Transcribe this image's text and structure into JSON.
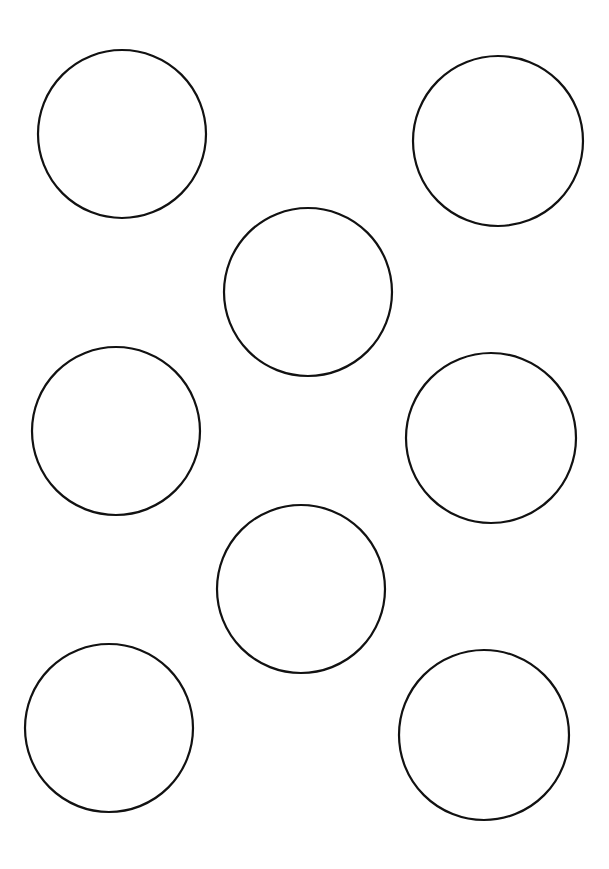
{
  "canvas": {
    "width": 609,
    "height": 869,
    "background": "#ffffff"
  },
  "style": {
    "stroke": "#111111",
    "stroke_width": 2.2,
    "fill": "none"
  },
  "circles": [
    {
      "id": "circle-1",
      "cx": 122,
      "cy": 134,
      "r": 84
    },
    {
      "id": "circle-2",
      "cx": 498,
      "cy": 141,
      "r": 85
    },
    {
      "id": "circle-3",
      "cx": 308,
      "cy": 292,
      "r": 84
    },
    {
      "id": "circle-4",
      "cx": 116,
      "cy": 431,
      "r": 84
    },
    {
      "id": "circle-5",
      "cx": 491,
      "cy": 438,
      "r": 85
    },
    {
      "id": "circle-6",
      "cx": 301,
      "cy": 589,
      "r": 84
    },
    {
      "id": "circle-7",
      "cx": 109,
      "cy": 728,
      "r": 84
    },
    {
      "id": "circle-8",
      "cx": 484,
      "cy": 735,
      "r": 85
    }
  ]
}
